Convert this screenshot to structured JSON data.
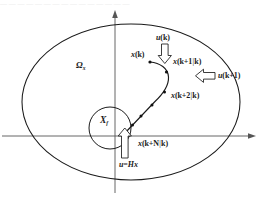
{
  "figure": {
    "kind": "mpc-state-space-diagram",
    "background_color": "#ffffff",
    "line_color": "#1a1a1a",
    "axis_color": "#4d4d4d",
    "top_clipped_text": "— — — — — — — — — — — — — — —",
    "labels": {
      "region_invariant_set": "Ω",
      "region_invariant_set_sub": "x",
      "terminal_set": "X",
      "terminal_set_sub": "f",
      "state_current": "x(k)",
      "state_pred_1": "x(k+1|k)",
      "state_pred_2": "x(k+2|k)",
      "state_pred_N": "x(k+N|k)",
      "input_k": "u(k)",
      "input_k1": "u(k+1)",
      "terminal_law": "u=Hx"
    },
    "label_parts": {
      "state_current_var": "x",
      "state_current_arg": "(k)",
      "state_pred_1_var": "x",
      "state_pred_1_a": "(k+1",
      "state_pred_1_bar": "|",
      "state_pred_1_b": "k)",
      "state_pred_2_var": "x",
      "state_pred_2_a": "(k+2",
      "state_pred_2_bar": "|",
      "state_pred_2_b": "k)",
      "state_pred_N_var": "x",
      "state_pred_N_a": "(k+N",
      "state_pred_N_bar": "|",
      "state_pred_N_b": "k)",
      "input_k_var": "u",
      "input_k_arg": "(k)",
      "input_k1_var": "u",
      "input_k1_arg": "(k+1)",
      "terminal_law_u": "u",
      "terminal_law_eq": "=",
      "terminal_law_h": "Hx"
    },
    "icons": {
      "arrow_down": "block-arrow-down-icon",
      "arrow_left": "block-arrow-left-icon",
      "arrow_up": "block-arrow-up-icon",
      "axis_arrow_right": "axis-arrow-right-icon",
      "axis_arrow_up": "axis-arrow-up-icon"
    },
    "geometry": {
      "axis_origin_x": 115,
      "axis_origin_y": 136,
      "axis_x_end": 252,
      "axis_y_top": 12,
      "axis_y_bottom": 193,
      "ellipse_cx": 131,
      "ellipse_cy": 102,
      "ellipse_rx": 109,
      "ellipse_ry": 78,
      "circle_cx": 110,
      "circle_cy": 128,
      "circle_r": 21,
      "trajectory_nodes": [
        [
          150,
          62
        ],
        [
          159,
          66
        ],
        [
          168,
          74
        ],
        [
          168,
          86
        ],
        [
          162,
          96
        ],
        [
          152,
          106
        ],
        [
          143,
          115
        ],
        [
          134,
          124
        ],
        [
          125,
          133
        ]
      ]
    }
  }
}
